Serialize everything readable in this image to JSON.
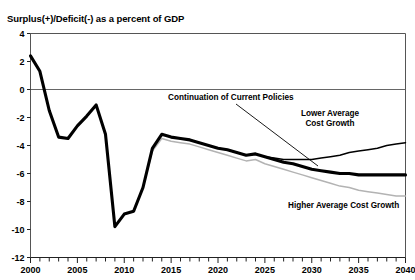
{
  "chart_data": {
    "type": "line",
    "title": "Surplus(+)/Deficit(-) as a percent of GDP",
    "xlabel": "",
    "ylabel": "",
    "xlim": [
      2000,
      2040
    ],
    "ylim": [
      -12,
      4
    ],
    "y_ticks": [
      "4",
      "2",
      "0",
      "-2",
      "-4",
      "-6",
      "-8",
      "-10",
      "-12"
    ],
    "y_tick_values": [
      4,
      2,
      0,
      -2,
      -4,
      -6,
      -8,
      -10,
      -12
    ],
    "x_ticks": [
      "2000",
      "2005",
      "2010",
      "2015",
      "2020",
      "2025",
      "2030",
      "2035",
      "2040"
    ],
    "x_tick_values": [
      2000,
      2005,
      2010,
      2015,
      2020,
      2025,
      2030,
      2035,
      2040
    ],
    "x_minor_tick_step": 1,
    "grid": false,
    "zero_line": true,
    "legend_position": "inline-annotations",
    "series": [
      {
        "name": "Continuation of Current Policies",
        "color": "#000000",
        "width": 3.1,
        "x": [
          2000,
          2001,
          2002,
          2003,
          2004,
          2005,
          2006,
          2007,
          2008,
          2009,
          2010,
          2011,
          2012,
          2013,
          2014,
          2015,
          2016,
          2017,
          2018,
          2019,
          2020,
          2021,
          2022,
          2023,
          2024,
          2025,
          2026,
          2027,
          2028,
          2029,
          2030,
          2031,
          2032,
          2033,
          2034,
          2035,
          2036,
          2037,
          2038,
          2039,
          2040
        ],
        "values": [
          2.4,
          1.3,
          -1.5,
          -3.4,
          -3.5,
          -2.6,
          -1.9,
          -1.1,
          -3.2,
          -9.8,
          -8.9,
          -8.7,
          -7.0,
          -4.2,
          -3.2,
          -3.4,
          -3.5,
          -3.6,
          -3.8,
          -4.0,
          -4.2,
          -4.3,
          -4.5,
          -4.7,
          -4.6,
          -4.8,
          -5.0,
          -5.2,
          -5.3,
          -5.5,
          -5.7,
          -5.8,
          -5.9,
          -6.0,
          -6.0,
          -6.1,
          -6.1,
          -6.1,
          -6.1,
          -6.1,
          -6.1
        ]
      },
      {
        "name": "Lower Average Cost Growth",
        "color": "#000000",
        "width": 1.5,
        "x": [
          2015,
          2016,
          2017,
          2018,
          2019,
          2020,
          2021,
          2022,
          2023,
          2024,
          2025,
          2026,
          2027,
          2028,
          2029,
          2030,
          2031,
          2032,
          2033,
          2034,
          2035,
          2036,
          2037,
          2038,
          2039,
          2040
        ],
        "values": [
          -3.4,
          -3.5,
          -3.6,
          -3.8,
          -4.0,
          -4.2,
          -4.3,
          -4.5,
          -4.7,
          -4.6,
          -4.8,
          -4.9,
          -5.0,
          -5.0,
          -5.0,
          -5.0,
          -4.9,
          -4.8,
          -4.7,
          -4.5,
          -4.4,
          -4.3,
          -4.2,
          -4.0,
          -3.9,
          -3.8
        ]
      },
      {
        "name": "Higher Average Cost Growth",
        "color": "#b3b3b3",
        "width": 1.5,
        "x": [
          2012,
          2013,
          2014,
          2015,
          2016,
          2017,
          2018,
          2019,
          2020,
          2021,
          2022,
          2023,
          2024,
          2025,
          2026,
          2027,
          2028,
          2029,
          2030,
          2031,
          2032,
          2033,
          2034,
          2035,
          2036,
          2037,
          2038,
          2039,
          2040
        ],
        "values": [
          -7.0,
          -4.4,
          -3.5,
          -3.7,
          -3.8,
          -3.9,
          -4.1,
          -4.3,
          -4.5,
          -4.7,
          -4.9,
          -5.1,
          -5.0,
          -5.3,
          -5.5,
          -5.7,
          -5.9,
          -6.1,
          -6.3,
          -6.5,
          -6.7,
          -6.9,
          -7.0,
          -7.2,
          -7.3,
          -7.4,
          -7.5,
          -7.6,
          -7.6
        ]
      }
    ],
    "annotations": [
      {
        "name": "continuation-of-current-policies",
        "text": "Continuation of Current Policies",
        "text_x": 168,
        "text_y": 100,
        "leader": {
          "x1": 236,
          "y1": 104,
          "x2": 318,
          "y2": 166
        }
      },
      {
        "name": "lower-average-cost-growth",
        "text_lines": [
          "Lower Average",
          "Cost Growth"
        ],
        "text_x": 330,
        "text_y": 116
      },
      {
        "name": "higher-average-cost-growth",
        "text_lines": [
          "Higher Average Cost Growth"
        ],
        "text_x": 288,
        "text_y": 208
      }
    ]
  }
}
